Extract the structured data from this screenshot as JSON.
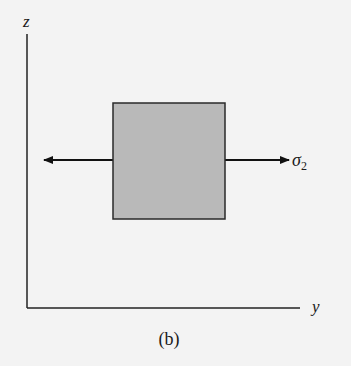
{
  "diagram": {
    "axes": {
      "vertical_label": "z",
      "horizontal_label": "y"
    },
    "element": {
      "fill": "#b9b9b9",
      "stroke": "#2a2a2a"
    },
    "stress": {
      "label_symbol": "σ",
      "label_subscript": "2",
      "direction": "horizontal (tension, both sides)"
    },
    "caption": "(b)"
  }
}
